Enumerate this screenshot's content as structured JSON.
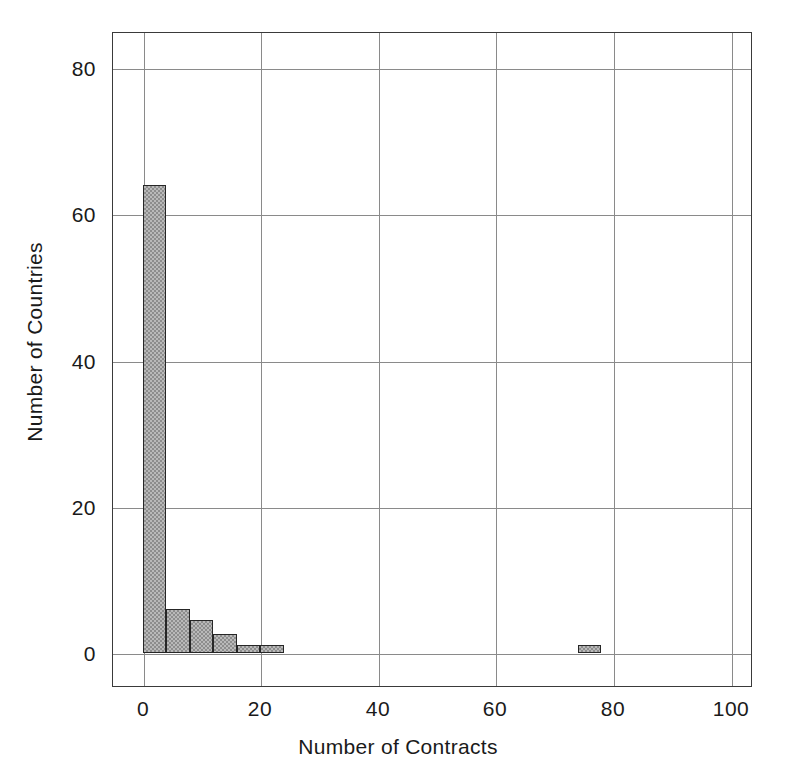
{
  "chart_data": {
    "type": "bar",
    "subtype": "histogram",
    "title": "",
    "xlabel": "Number of Contracts",
    "ylabel": "Number of Countries",
    "xlim": [
      -4,
      104
    ],
    "ylim": [
      -8,
      89
    ],
    "grid": true,
    "legend": null,
    "bin_width": 4,
    "x_ticks": [
      0,
      20,
      40,
      60,
      80,
      100
    ],
    "x_tick_labels": [
      "0",
      "20",
      "40",
      "60",
      "80",
      "100"
    ],
    "y_ticks": [
      0,
      20,
      40,
      60,
      80
    ],
    "y_tick_labels": [
      "0",
      "20",
      "40",
      "60",
      "80"
    ],
    "bins": [
      {
        "x0": 0,
        "x1": 4,
        "value": 64
      },
      {
        "x0": 4,
        "x1": 8,
        "value": 6
      },
      {
        "x0": 8,
        "x1": 12,
        "value": 4.5
      },
      {
        "x0": 12,
        "x1": 16,
        "value": 2.5
      },
      {
        "x0": 16,
        "x1": 20,
        "value": 1
      },
      {
        "x0": 20,
        "x1": 24,
        "value": 1
      },
      {
        "x0": 74,
        "x1": 78,
        "value": 1
      }
    ],
    "categories": [
      "0-4",
      "4-8",
      "8-12",
      "12-16",
      "16-20",
      "20-24",
      "74-78"
    ],
    "values": [
      64,
      6,
      4.5,
      2.5,
      1,
      1,
      1
    ],
    "colors": {
      "bar_fill": "#b9b9b9",
      "bar_hatch": "#8d8d8d",
      "bar_edge": "#262626",
      "grid": "#8a8a8a",
      "frame": "#3a3a3a",
      "text": "#1a1a1a",
      "background": "#ffffff"
    }
  }
}
